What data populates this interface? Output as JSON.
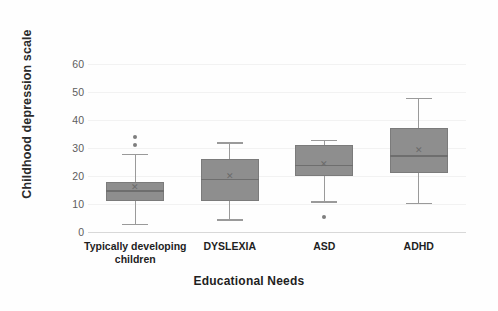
{
  "chart_data": {
    "type": "box",
    "title": "",
    "xlabel": "Educational  Needs",
    "ylabel": "Childhood depression scale",
    "ylim": [
      0,
      65
    ],
    "yticks": [
      0,
      10,
      20,
      30,
      40,
      50,
      60
    ],
    "grid": true,
    "legend": "none",
    "categories": [
      "Typically developing children",
      "DYSLEXIA",
      "ASD",
      "ADHD"
    ],
    "boxes": [
      {
        "category": "Typically developing children",
        "whisker_low": 3,
        "q1": 11,
        "median": 15,
        "q3": 18,
        "whisker_high": 28,
        "mean": 16,
        "outliers": [
          31,
          34
        ]
      },
      {
        "category": "DYSLEXIA",
        "whisker_low": 4.5,
        "q1": 11,
        "median": 19,
        "q3": 26,
        "whisker_high": 32,
        "mean": 20,
        "outliers": []
      },
      {
        "category": "ASD",
        "whisker_low": 11,
        "q1": 20,
        "median": 24,
        "q3": 31,
        "whisker_high": 33,
        "mean": 24,
        "outliers": [
          5.5
        ]
      },
      {
        "category": "ADHD",
        "whisker_low": 10.5,
        "q1": 21,
        "median": 27.5,
        "q3": 37,
        "whisker_high": 48,
        "mean": 29,
        "outliers": []
      }
    ],
    "colors": {
      "box_fill": "#8e8e8e",
      "box_edge": "#7b7b7b",
      "whisker": "#9a9a9a",
      "median": "#6e6e6e",
      "outlier": "#7e7e7e",
      "grid": "#f2f2f2",
      "background": "#fefefe",
      "tick_text": "#5d5d5d",
      "label_text": "#1f1f1f"
    }
  },
  "axis": {
    "y_title": "Childhood depression scale",
    "x_title": "Educational  Needs",
    "y_tick_labels": [
      "60",
      "50",
      "40",
      "30",
      "20",
      "10",
      "0"
    ]
  },
  "categories_display": [
    {
      "line1": "Typically developing",
      "line2": "children"
    },
    {
      "line1": "DYSLEXIA",
      "line2": ""
    },
    {
      "line1": "ASD",
      "line2": ""
    },
    {
      "line1": "ADHD",
      "line2": ""
    }
  ]
}
